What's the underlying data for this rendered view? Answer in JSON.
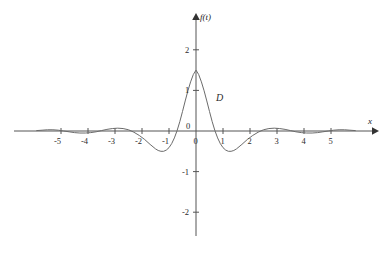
{
  "chart_data": {
    "type": "line",
    "title": "",
    "xlabel": "x",
    "ylabel": "f(t)",
    "curve_label": "D",
    "grid": false,
    "legend": "none",
    "xlim": [
      -5.9,
      5.9
    ],
    "ylim": [
      -2.6,
      2.6
    ],
    "xticks": [
      -5,
      -4,
      -3,
      -2,
      -1,
      0,
      1,
      2,
      3,
      4,
      5
    ],
    "xtick_labels": [
      "-5",
      "-4",
      "-3",
      "-2",
      "-1",
      "0",
      "1",
      "2",
      "3",
      "4",
      "5"
    ],
    "yticks": [
      -2,
      -1,
      0,
      1,
      2
    ],
    "ytick_labels": [
      "-2",
      "-1",
      "0",
      "1",
      "2"
    ],
    "series": [
      {
        "name": "D",
        "color": "#6b6b6b",
        "description": "damped oscillation, sinc-like, even symmetry",
        "peak_value": 1.5,
        "peak_x": 0,
        "x": [
          -5.9,
          -5.7,
          -5.5,
          -5.3,
          -5.1,
          -4.9,
          -4.7,
          -4.5,
          -4.3,
          -4.1,
          -3.9,
          -3.7,
          -3.5,
          -3.3,
          -3.1,
          -2.9,
          -2.7,
          -2.5,
          -2.3,
          -2.1,
          -1.9,
          -1.7,
          -1.5,
          -1.4,
          -1.3,
          -1.2,
          -1.1,
          -1.0,
          -0.9,
          -0.8,
          -0.7,
          -0.6,
          -0.5,
          -0.4,
          -0.3,
          -0.2,
          -0.1,
          0.0,
          0.1,
          0.2,
          0.3,
          0.4,
          0.5,
          0.6,
          0.7,
          0.8,
          0.9,
          1.0,
          1.1,
          1.2,
          1.3,
          1.4,
          1.5,
          1.7,
          1.9,
          2.1,
          2.3,
          2.5,
          2.7,
          2.9,
          3.1,
          3.3,
          3.5,
          3.7,
          3.9,
          4.1,
          4.3,
          4.5,
          4.7,
          4.9,
          5.1,
          5.3,
          5.5,
          5.7,
          5.9
        ],
        "y": [
          0.01,
          0.02,
          0.03,
          0.03,
          0.02,
          0.0,
          -0.02,
          -0.04,
          -0.05,
          -0.05,
          -0.04,
          -0.02,
          0.01,
          0.04,
          0.06,
          0.07,
          0.06,
          0.03,
          -0.03,
          -0.11,
          -0.21,
          -0.33,
          -0.44,
          -0.48,
          -0.5,
          -0.5,
          -0.47,
          -0.41,
          -0.31,
          -0.17,
          0.01,
          0.23,
          0.48,
          0.74,
          0.99,
          1.21,
          1.39,
          1.5,
          1.39,
          1.21,
          0.99,
          0.74,
          0.48,
          0.23,
          0.01,
          -0.17,
          -0.31,
          -0.41,
          -0.47,
          -0.5,
          -0.5,
          -0.48,
          -0.44,
          -0.33,
          -0.21,
          -0.11,
          -0.03,
          0.03,
          0.06,
          0.07,
          0.06,
          0.04,
          0.01,
          -0.02,
          -0.04,
          -0.05,
          -0.05,
          -0.04,
          -0.02,
          0.0,
          0.02,
          0.03,
          0.03,
          0.02,
          0.01
        ]
      }
    ]
  },
  "axes": {
    "y_axis_label": "f(t)",
    "x_axis_label": "x",
    "curve_label": "D"
  },
  "ticks": {
    "x": [
      {
        "label": "-5",
        "value": -5
      },
      {
        "label": "-4",
        "value": -4
      },
      {
        "label": "-3",
        "value": -3
      },
      {
        "label": "-2",
        "value": -2
      },
      {
        "label": "-1",
        "value": -1
      },
      {
        "label": "0",
        "value": 0
      },
      {
        "label": "1",
        "value": 1
      },
      {
        "label": "2",
        "value": 2
      },
      {
        "label": "3",
        "value": 3
      },
      {
        "label": "4",
        "value": 4
      },
      {
        "label": "5",
        "value": 5
      }
    ],
    "y": [
      {
        "label": "2",
        "value": 2
      },
      {
        "label": "1",
        "value": 1
      },
      {
        "label": "-1",
        "value": -1
      },
      {
        "label": "-2",
        "value": -2
      }
    ]
  },
  "colors": {
    "curve": "#6b6b6b",
    "axis": "#555555",
    "frame": "#777777",
    "text": "#2b2b2b"
  }
}
